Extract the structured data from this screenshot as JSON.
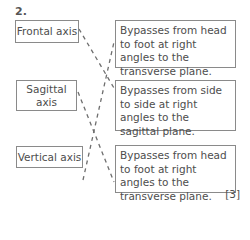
{
  "question": {
    "number": "2.",
    "left_items": [
      {
        "label": "Frontal axis"
      },
      {
        "label": "Sagittal axis"
      },
      {
        "label": "Vertical axis"
      }
    ],
    "right_items": [
      {
        "text": "Bypasses from head to foot at right angles to the transverse plane."
      },
      {
        "text": "Bypasses from side to side at right angles to the sagittal plane."
      },
      {
        "text": "Bypasses from head to foot at right angles to the transverse plane."
      }
    ],
    "connections": [
      {
        "from": "Frontal axis",
        "to_index": 1
      },
      {
        "from": "Sagittal axis",
        "to_index": 2
      },
      {
        "from": "Vertical axis",
        "to_index": 0
      }
    ],
    "marks": "[3]"
  },
  "colors": {
    "line": "#6e6e6e",
    "border": "#8a8a8a",
    "text": "#4d4d4d"
  }
}
